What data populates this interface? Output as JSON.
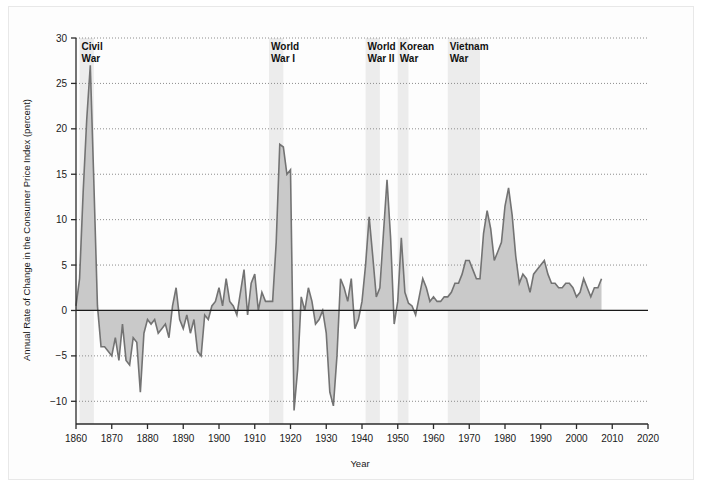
{
  "figure": {
    "caption_present": false
  },
  "chart_data": {
    "type": "area",
    "title": "",
    "xlabel": "Year",
    "ylabel": "Annual Rate of Change in the Consumer Price Index (percent)",
    "xlim": [
      1860,
      2020
    ],
    "ylim": [
      -12.5,
      30
    ],
    "xticks": [
      1860,
      1870,
      1880,
      1890,
      1900,
      1910,
      1920,
      1930,
      1940,
      1950,
      1960,
      1970,
      1980,
      1990,
      2000,
      2010,
      2020
    ],
    "yticks": [
      -10,
      -5,
      0,
      5,
      10,
      15,
      20,
      25,
      30
    ],
    "ytick_labels": [
      "−10",
      "−5",
      "0",
      "5",
      "10",
      "15",
      "20",
      "25",
      "30"
    ],
    "xtick_labels": [
      "1860",
      "1870",
      "1880",
      "1890",
      "1900",
      "1910",
      "1920",
      "1930",
      "1940",
      "1950",
      "1960",
      "1970",
      "1980",
      "1990",
      "2000",
      "2010",
      "2020"
    ],
    "grid": "horizontal-dotted",
    "legend": "none",
    "series_name": "Annual rate of change in CPI",
    "line_color": "#737373",
    "fill_color": "#c9c9c9",
    "axis_color": "#2b2b2b",
    "grid_color": "#8c8c8c",
    "band_color": "#ececec",
    "x": [
      1860,
      1861,
      1862,
      1863,
      1864,
      1865,
      1866,
      1867,
      1868,
      1869,
      1870,
      1871,
      1872,
      1873,
      1874,
      1875,
      1876,
      1877,
      1878,
      1879,
      1880,
      1881,
      1882,
      1883,
      1884,
      1885,
      1886,
      1887,
      1888,
      1889,
      1890,
      1891,
      1892,
      1893,
      1894,
      1895,
      1896,
      1897,
      1898,
      1899,
      1900,
      1901,
      1902,
      1903,
      1904,
      1905,
      1906,
      1907,
      1908,
      1909,
      1910,
      1911,
      1912,
      1913,
      1914,
      1915,
      1916,
      1917,
      1918,
      1919,
      1920,
      1921,
      1922,
      1923,
      1924,
      1925,
      1926,
      1927,
      1928,
      1929,
      1930,
      1931,
      1932,
      1933,
      1934,
      1935,
      1936,
      1937,
      1938,
      1939,
      1940,
      1941,
      1942,
      1943,
      1944,
      1945,
      1946,
      1947,
      1948,
      1949,
      1950,
      1951,
      1952,
      1953,
      1954,
      1955,
      1956,
      1957,
      1958,
      1959,
      1960,
      1961,
      1962,
      1963,
      1964,
      1965,
      1966,
      1967,
      1968,
      1969,
      1970,
      1971,
      1972,
      1973,
      1974,
      1975,
      1976,
      1977,
      1978,
      1979,
      1980,
      1981,
      1982,
      1983,
      1984,
      1985,
      1986,
      1987,
      1988,
      1989,
      1990,
      1991,
      1992,
      1993,
      1994,
      1995,
      1996,
      1997,
      1998,
      1999,
      2000,
      2001,
      2002,
      2003,
      2004,
      2005,
      2006,
      2007
    ],
    "y": [
      0.5,
      3.5,
      13.0,
      21.0,
      27.0,
      14.0,
      0.5,
      -4.0,
      -4.0,
      -4.5,
      -5.0,
      -3.0,
      -5.5,
      -1.5,
      -5.5,
      -6.0,
      -3.0,
      -3.5,
      -9.0,
      -2.5,
      -1.0,
      -1.5,
      -1.0,
      -2.5,
      -2.0,
      -1.5,
      -3.0,
      0.5,
      2.5,
      -1.0,
      -2.0,
      -0.5,
      -2.5,
      -1.0,
      -4.5,
      -5.0,
      -0.5,
      -1.0,
      0.5,
      1.0,
      2.5,
      0.5,
      3.5,
      1.0,
      0.5,
      -0.5,
      2.0,
      4.5,
      -0.5,
      3.0,
      4.0,
      0.0,
      2.0,
      1.0,
      1.0,
      1.0,
      7.5,
      18.3,
      18.0,
      15.0,
      15.5,
      -11.0,
      -6.5,
      1.5,
      0.0,
      2.5,
      1.0,
      -1.5,
      -1.0,
      0.0,
      -2.5,
      -9.0,
      -10.5,
      -5.0,
      3.5,
      2.5,
      1.0,
      3.5,
      -2.0,
      -1.0,
      1.0,
      5.0,
      10.3,
      6.0,
      1.5,
      2.5,
      8.5,
      14.4,
      8.0,
      -1.5,
      1.0,
      8.0,
      2.0,
      0.8,
      0.5,
      -0.5,
      1.5,
      3.5,
      2.5,
      1.0,
      1.5,
      1.0,
      1.0,
      1.5,
      1.5,
      2.0,
      3.0,
      3.0,
      4.0,
      5.5,
      5.5,
      4.5,
      3.5,
      3.5,
      8.5,
      11.0,
      9.0,
      5.5,
      6.5,
      7.5,
      11.5,
      13.5,
      10.5,
      6.0,
      3.0,
      4.0,
      3.5,
      2.0,
      4.0,
      4.5,
      5.0,
      5.5,
      4.0,
      3.0,
      3.0,
      2.5,
      2.5,
      3.0,
      3.0,
      2.5,
      1.5,
      2.0,
      3.5,
      2.5,
      1.5,
      2.5,
      2.5,
      3.5,
      3.0,
      3.8
    ],
    "wars": [
      {
        "label_line1": "Civil",
        "label_line2": "War",
        "start": 1861,
        "end": 1865
      },
      {
        "label_line1": "World",
        "label_line2": "War I",
        "start": 1914,
        "end": 1918
      },
      {
        "label_line1": "World",
        "label_line2": "War II",
        "start": 1941,
        "end": 1945
      },
      {
        "label_line1": "Korean",
        "label_line2": "War",
        "start": 1950,
        "end": 1953
      },
      {
        "label_line1": "Vietnam",
        "label_line2": "War",
        "start": 1964,
        "end": 1973
      }
    ]
  }
}
